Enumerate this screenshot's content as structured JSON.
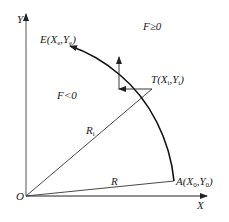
{
  "diagram": {
    "axes": {
      "x_label": "X",
      "y_label": "Y",
      "origin_label": "O"
    },
    "regions": {
      "outside": "F≥0",
      "inside": "F<0"
    },
    "points": {
      "start": {
        "name": "A",
        "coords": "(X",
        "sub1": "0",
        "mid": ",Y",
        "sub2": "0",
        "close": ")"
      },
      "end": {
        "name": "E",
        "coords": "(X",
        "sub1": "e",
        "mid": ",Y",
        "sub2": "e",
        "close": ")"
      },
      "current": {
        "name": "T",
        "coords": "(X",
        "sub1": "i",
        "mid": ",Y",
        "sub2": "i",
        "close": ")"
      }
    },
    "radii": {
      "R": "R",
      "Ri": "R",
      "Ri_sub": "i"
    },
    "colors": {
      "line": "#222222",
      "background": "#ffffff"
    }
  }
}
